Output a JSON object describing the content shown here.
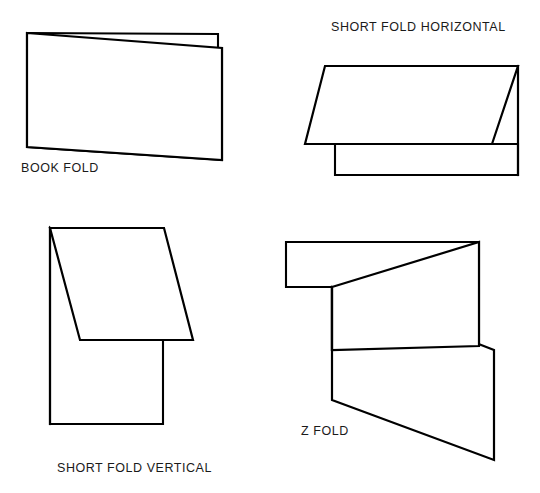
{
  "diagram": {
    "background_color": "#ffffff",
    "line_color": "#000000",
    "fill_color": "#ffffff",
    "label_color": "#1a1a1a",
    "width": 540,
    "height": 493
  },
  "folds": [
    {
      "id": "book-fold",
      "label": "BOOK FOLD",
      "description": "Single centre fold forming two equal panels, shown as a wide front panel with a back panel edge visible above and to the right.",
      "panels": 2,
      "back_panel_points": "27,33 218,34 218,48 222,48 222,160 27,147",
      "front_panel_points": "27,33 222,48 222,160 27,147",
      "fold_edges": []
    },
    {
      "id": "short-fold-horizontal",
      "label": "SHORT FOLD HORIZONTAL",
      "description": "Horizontal short fold: a slanted parallelogram flap lies over a shorter rectangular back panel.",
      "panels": 2,
      "back_panel_points": "335,144 518,144 518,175 335,175",
      "front_panel_points": "325,66 518,66 492,144 305,144",
      "fold_edges": [
        "518,66 518,175"
      ]
    },
    {
      "id": "short-fold-vertical",
      "label": "SHORT FOLD VERTICAL",
      "description": "Vertical short fold: a slanted parallelogram flap folded down over a taller rectangular back panel.",
      "panels": 2,
      "back_panel_points": "50,228 163,340 163,424 50,424",
      "front_panel_points": "50,228 164,228 193,340 80,340",
      "fold_edges": [
        "50,228 50,424"
      ]
    },
    {
      "id": "z-fold",
      "label": "Z FOLD",
      "description": "Accordion Z fold: three panels in a zigzag, a rear rectangle, a receding middle panel, and a front panel angling forward.",
      "panels": 3,
      "back_panel_points": "286,242 479,242 479,346 332,350 332,287 286,287",
      "front_panel_points": "332,287 479,242 479,346 332,350",
      "third_panel_points": "332,287 494,350 494,460 332,400",
      "fold_edges": [
        "332,287 332,350",
        "479,242 479,346"
      ]
    }
  ]
}
